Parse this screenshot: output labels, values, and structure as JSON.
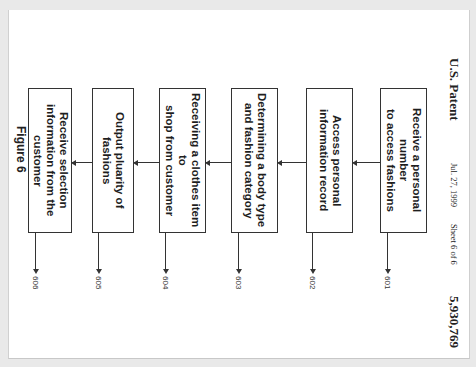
{
  "header": {
    "office": "U.S. Patent",
    "date": "Jul. 27, 1999",
    "sheet": "Sheet 6 of 6",
    "patent_number": "5,930,769"
  },
  "figure": {
    "caption": "Figure 6",
    "steps": [
      {
        "ref": "601",
        "label": "Receive a personal number\nto access fashions"
      },
      {
        "ref": "602",
        "label": "Access personal\ninformation record"
      },
      {
        "ref": "603",
        "label": "Determining a body type\nand fashion category"
      },
      {
        "ref": "604",
        "label": "Receiving a clothes item to\nshop from customer"
      },
      {
        "ref": "605",
        "label": "Output pluarity of fashions"
      },
      {
        "ref": "606",
        "label": "Receive selection\ninformation from the\ncustomer"
      }
    ]
  }
}
